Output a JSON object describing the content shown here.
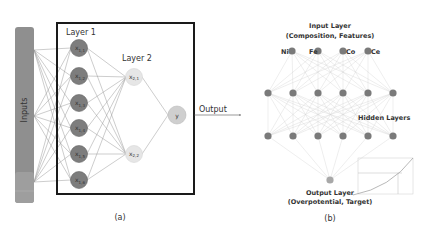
{
  "panel_a": {
    "caption": "(a)",
    "inputs_label": "Inputs",
    "layer1_label": "Layer 1",
    "layer2_label": "Layer 2",
    "output_label": "Output",
    "layer1_nodes": [
      {
        "main": "x",
        "sub": "1,1"
      },
      {
        "main": "x",
        "sub": "1,2"
      },
      {
        "main": "x",
        "sub": "1,3"
      },
      {
        "main": "x",
        "sub": "1,4"
      },
      {
        "main": "x",
        "sub": "1,5"
      },
      {
        "main": "x",
        "sub": "1,6"
      }
    ],
    "layer2_nodes": [
      {
        "main": "x",
        "sub": "2,1"
      },
      {
        "main": "x",
        "sub": "2,2"
      }
    ],
    "output_node": "y",
    "colors": {
      "inputs_bar": "#8f8f8f",
      "layer1_node": "#7d7d7d",
      "layer2_node": "#e6e6e6",
      "output_node": "#cfcfcf",
      "frame": "#1a1a1a",
      "edges": "#9a9a9a"
    }
  },
  "panel_b": {
    "caption": "(b)",
    "input_layer_title": "Input Layer",
    "input_layer_subtitle": "(Composition, Features)",
    "input_nodes": [
      "Ni",
      "Fe",
      "Co",
      "Ce"
    ],
    "hidden_layers_label": "Hidden Layers",
    "hidden_layer_count": 2,
    "hidden_nodes_per_layer": 6,
    "output_layer_title": "Output Layer",
    "output_layer_subtitle": "(Overpotential, Target)",
    "colors": {
      "node": "#7a7a7a",
      "output_node": "#a8a8a8",
      "edges": "#d5d5d5"
    }
  }
}
